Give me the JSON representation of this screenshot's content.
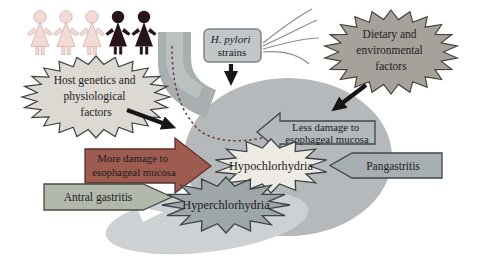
{
  "figure": {
    "people": {
      "light_color": "#f2dad6",
      "light_outline": "#dcbcb6",
      "dark_color": "#281519",
      "count_light": 3,
      "count_dark": 2
    },
    "stomach": {
      "body_color": "#b5b9bb",
      "esophagus_color": "#a9aeb0",
      "lumen_color": "#bfc4c6",
      "antrum_color": "#cdd1d3",
      "migration_path_color": "#6e3c33"
    },
    "flagella_color": "#888c8e",
    "arrow_color": "#161616",
    "nodes": {
      "host_genetics": {
        "lines": [
          "Host genetics and",
          "physiological",
          "factors"
        ],
        "fill": "#dcd8d2"
      },
      "h_pylori": {
        "line1": "H. pylori",
        "line2": "strains",
        "fill": "#c2c6c8"
      },
      "dietary": {
        "lines": [
          "Dietary and",
          "environmental",
          "factors"
        ],
        "fill": "#a7a19b"
      },
      "less_damage": {
        "lines": [
          "Less damage to",
          "esophageal mucosa"
        ],
        "fill": "#b2b8bb"
      },
      "more_damage": {
        "lines": [
          "More damage to",
          "esophageal mucosa"
        ],
        "fill": "#9e5b50",
        "text_color": "#33201a"
      },
      "hypochlorhydria": {
        "label": "Hypochlorhydria",
        "fill": "#edebe4"
      },
      "hyperchlorhydria": {
        "label": "Hyperchlorhydria",
        "fill": "#9ea6a9"
      },
      "pangastritis": {
        "label": "Pangastritis",
        "fill": "#a8afb2"
      },
      "antral_gastritis": {
        "label": "Antral gastritis",
        "fill": "#b3b8ad"
      }
    }
  }
}
